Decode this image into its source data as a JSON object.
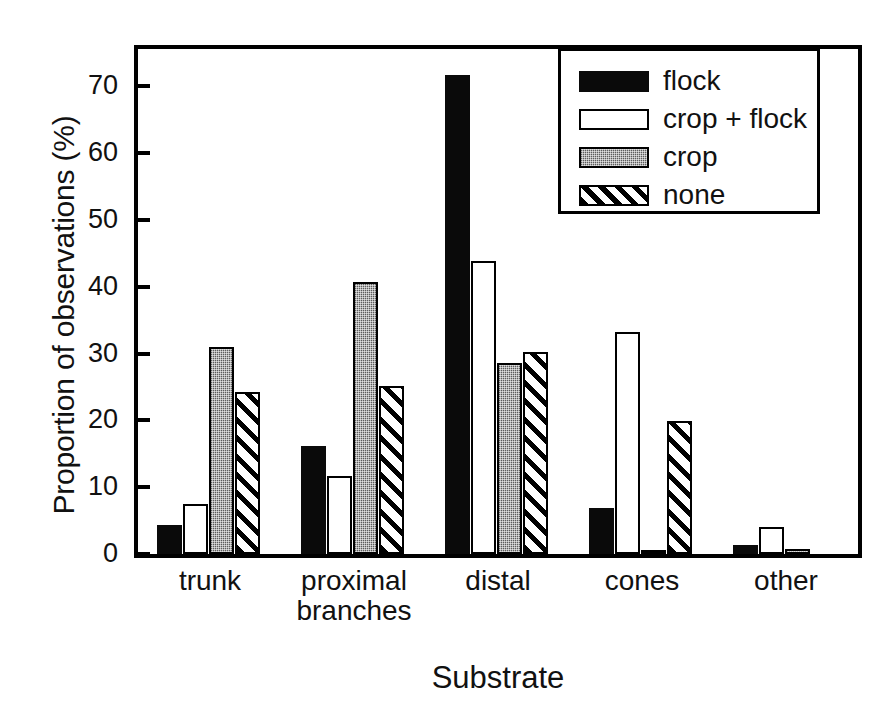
{
  "chart_data": {
    "type": "bar",
    "title": "",
    "xlabel": "Substrate",
    "ylabel": "Proportion of observations (%)",
    "ylim": [
      0,
      75.6
    ],
    "yticks": [
      0,
      10,
      20,
      30,
      40,
      50,
      60,
      70
    ],
    "ytick_labels": [
      "0",
      "10",
      "20",
      "30",
      "40",
      "50",
      "60",
      "70"
    ],
    "grid": false,
    "legend_position": "upper right",
    "categories": [
      "trunk",
      "proximal\nbranches",
      "distal",
      "cones",
      "other"
    ],
    "category_labels": [
      "trunk",
      "proximal branches",
      "distal",
      "cones",
      "other"
    ],
    "series": [
      {
        "name": "flock",
        "values": [
          4.4,
          16.1,
          71.7,
          6.9,
          1.3
        ]
      },
      {
        "name": "crop + flock",
        "values": [
          7.5,
          11.7,
          43.8,
          33.3,
          4.0
        ]
      },
      {
        "name": "crop",
        "values": [
          31.0,
          40.7,
          28.6,
          0.4,
          0.7
        ]
      },
      {
        "name": "none",
        "values": [
          24.2,
          25.1,
          30.3,
          19.9,
          0.0
        ]
      }
    ]
  },
  "axes": {
    "ylabel": "Proportion of observations (%)",
    "xlabel": "Substrate",
    "ytick_labels": [
      "70",
      "60",
      "50",
      "40",
      "30",
      "20",
      "10",
      "0"
    ],
    "xtick_labels": [
      "trunk",
      "proximal\nbranches",
      "distal",
      "cones",
      "other"
    ]
  },
  "legend": {
    "items": [
      {
        "label": "flock",
        "style": "flock"
      },
      {
        "label": "crop + flock",
        "style": "cropflock"
      },
      {
        "label": "crop",
        "style": "crop"
      },
      {
        "label": "none",
        "style": "none"
      }
    ]
  },
  "colors": {
    "ink": "#111111",
    "flock": "#0a0a0a",
    "crop_plus_flock": "#ffffff",
    "crop": "#8d8d8d",
    "none": "#ffffff",
    "background": "#ffffff"
  }
}
